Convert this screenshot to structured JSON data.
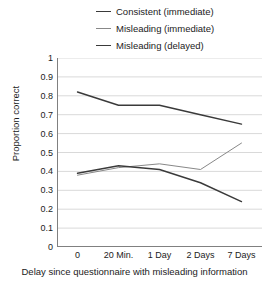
{
  "chart_data": {
    "type": "line",
    "title": "",
    "xlabel": "Delay since questionnaire with misleading information",
    "ylabel": "Proportion correct",
    "categories": [
      "0",
      "20 Min.",
      "1 Day",
      "2 Days",
      "7 Days"
    ],
    "ylim": [
      0,
      1
    ],
    "ytick_labels": [
      "1",
      "0.9",
      "0.8",
      "0.7",
      "0.6",
      "0.5",
      "0.4",
      "0.3",
      "0.2",
      "0.1",
      "0"
    ],
    "ytick_values": [
      1,
      0.9,
      0.8,
      0.7,
      0.6,
      0.5,
      0.4,
      0.3,
      0.2,
      0.1,
      0
    ],
    "grid": true,
    "grid_axis": "y",
    "legend_position": "top-right",
    "series": [
      {
        "name": "Consistent (immediate)",
        "color": "#3a3a3a",
        "values": [
          0.82,
          0.75,
          0.75,
          0.7,
          0.65
        ]
      },
      {
        "name": "Misleading (immediate)",
        "color": "#888888",
        "values": [
          0.38,
          0.42,
          0.44,
          0.41,
          0.55
        ]
      },
      {
        "name": "Misleading (delayed)",
        "color": "#3a3a3a",
        "values": [
          0.39,
          0.43,
          0.41,
          0.34,
          0.24
        ]
      }
    ]
  },
  "axes": {
    "grid_color": "#d9d9d9",
    "axis_color": "#808080"
  }
}
